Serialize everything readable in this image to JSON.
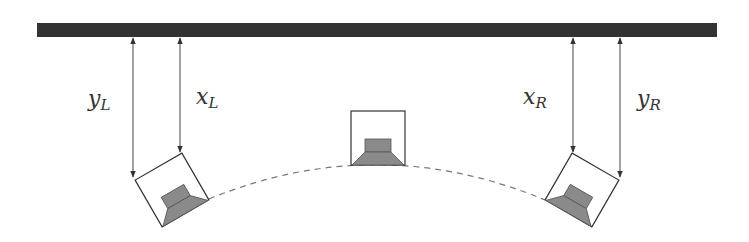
{
  "diagram": {
    "title": "",
    "colors": {
      "wall": "#333333",
      "line": "#444444",
      "speaker_fill": "#8a8a8a",
      "speaker_box_fill": "#ffffff",
      "dash": "#777777"
    },
    "wall": {
      "label": "wall"
    },
    "labels": {
      "y_left": {
        "main": "y",
        "sub": "L"
      },
      "x_left": {
        "main": "x",
        "sub": "L"
      },
      "x_right": {
        "main": "x",
        "sub": "R"
      },
      "y_right": {
        "main": "y",
        "sub": "R"
      }
    },
    "speakers": [
      {
        "id": "left",
        "rotation_deg": -30
      },
      {
        "id": "center",
        "rotation_deg": 0
      },
      {
        "id": "right",
        "rotation_deg": 30
      }
    ],
    "arc": {
      "style": "dashed"
    }
  }
}
